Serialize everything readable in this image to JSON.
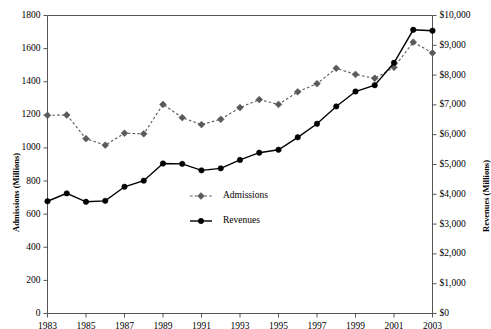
{
  "chart_data": {
    "type": "line",
    "title": "",
    "subtitle": "",
    "xlabel": "",
    "ylabel": "Admissions (Millions)",
    "y2label": "Revenues (Millions)",
    "grid": false,
    "legend_position": "center-inside",
    "x": [
      1983,
      1984,
      1985,
      1986,
      1987,
      1988,
      1989,
      1990,
      1991,
      1992,
      1993,
      1994,
      1995,
      1996,
      1997,
      1998,
      1999,
      2000,
      2001,
      2002,
      2003
    ],
    "xtick_labels": [
      "1983",
      "1985",
      "1987",
      "1989",
      "1991",
      "1993",
      "1995",
      "1997",
      "1999",
      "2001",
      "2003"
    ],
    "xticks": [
      1983,
      1985,
      1987,
      1989,
      1991,
      1993,
      1995,
      1997,
      1999,
      2001,
      2003
    ],
    "xlim": [
      1983,
      2003
    ],
    "ylim": [
      0,
      1800
    ],
    "yticks": [
      0,
      200,
      400,
      600,
      800,
      1000,
      1200,
      1400,
      1600,
      1800
    ],
    "ytick_labels": [
      "0",
      "200",
      "400",
      "600",
      "800",
      "1000",
      "1200",
      "1400",
      "1600",
      "1800"
    ],
    "y2lim": [
      0,
      10000
    ],
    "y2ticks": [
      0,
      1000,
      2000,
      3000,
      4000,
      5000,
      6000,
      7000,
      8000,
      9000,
      10000
    ],
    "y2tick_labels": [
      "$0",
      "$1,000",
      "$2,000",
      "$3,000",
      "$4,000",
      "$5,000",
      "$6,000",
      "$7,000",
      "$8,000",
      "$9,000",
      "$10,000"
    ],
    "series": [
      {
        "name": "Admissions",
        "axis": "left",
        "color": "#5a5a5a",
        "marker": "diamond",
        "linestyle": "dashed",
        "values": [
          1197,
          1199,
          1056,
          1017,
          1089,
          1085,
          1263,
          1183,
          1141,
          1173,
          1244,
          1292,
          1263,
          1339,
          1388,
          1481,
          1444,
          1421,
          1487,
          1639,
          1574
        ]
      },
      {
        "name": "Revenues",
        "axis": "right",
        "color": "#000000",
        "marker": "circle",
        "linestyle": "solid",
        "values": [
          3766,
          4031,
          3749,
          3780,
          4253,
          4458,
          5033,
          5022,
          4803,
          4871,
          5154,
          5396,
          5494,
          5912,
          6366,
          6949,
          7448,
          7661,
          8413,
          9520,
          9490
        ]
      }
    ]
  },
  "legend": {
    "items": [
      {
        "label": "Admissions"
      },
      {
        "label": "Revenues"
      }
    ]
  },
  "axes": {
    "left_title": "Admissions (Millions)",
    "right_title": "Revenues (Millions)"
  },
  "colors": {
    "admissions": "#5a5a5a",
    "revenues": "#000000",
    "axis": "#555555"
  }
}
